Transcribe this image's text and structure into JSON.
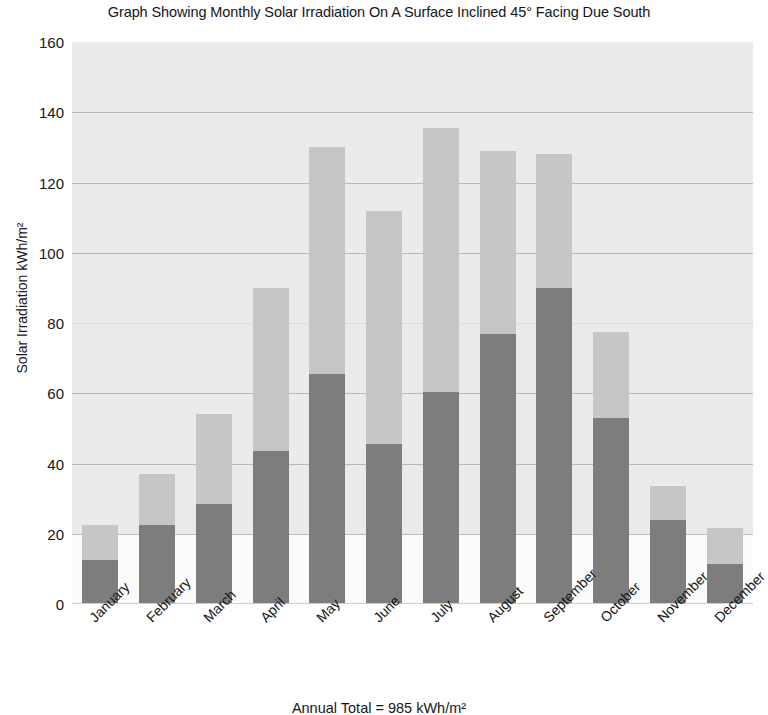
{
  "chart_data": {
    "type": "bar",
    "subtype": "stacked-bar",
    "title": "Graph Showing Monthly Solar Irradiation On A Surface Inclined 45° Facing Due South",
    "xlabel": "",
    "ylabel": "Solar Irradiation kWh/m²",
    "ylim": [
      0,
      160
    ],
    "ytick_step": 20,
    "yticks": [
      160,
      140,
      120,
      100,
      80,
      60,
      40,
      20,
      0
    ],
    "grid": true,
    "grid_axis": "y",
    "legend": null,
    "categories": [
      "January",
      "February",
      "March",
      "April",
      "May",
      "June",
      "July",
      "August",
      "September",
      "October",
      "November",
      "December"
    ],
    "series": [
      {
        "name": "Direct irradiation",
        "color": "#7d7d7d",
        "stack_position": "bottom",
        "values": [
          12.5,
          22.5,
          28.5,
          43.5,
          65.5,
          45.5,
          60.5,
          77.0,
          90.0,
          53.0,
          24.0,
          11.5
        ]
      },
      {
        "name": "Diffuse irradiation",
        "color": "#c6c6c6",
        "stack_position": "top",
        "values": [
          10.0,
          14.5,
          25.5,
          46.5,
          64.5,
          66.5,
          75.0,
          52.0,
          38.0,
          24.5,
          9.5,
          10.0
        ]
      }
    ],
    "totals": [
      22.5,
      37.0,
      54.0,
      90.0,
      130.0,
      112.0,
      135.5,
      129.0,
      128.0,
      77.5,
      33.5,
      21.5
    ],
    "annotations": [
      {
        "name": "annual-total",
        "text": "Annual Total = 985 kWh/m²"
      }
    ]
  },
  "figure": {
    "title": "Graph Showing Monthly Solar Irradiation On A Surface Inclined 45° Facing Due South",
    "y_axis_title": "Solar Irradiation kWh/m²",
    "annual_total": "Annual Total = 985 kWh/m²",
    "plot_background": "#ebebeb",
    "gridline_color": "#b9b9b9",
    "bar_color_direct": "#7d7d7d",
    "bar_color_diffuse": "#c6c6c6"
  }
}
